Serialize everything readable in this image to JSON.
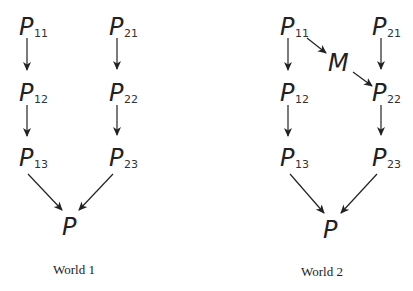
{
  "worlds": [
    {
      "caption": "World 1",
      "nodes": {
        "p11": {
          "base": "P",
          "sub": "11"
        },
        "p12": {
          "base": "P",
          "sub": "12"
        },
        "p13": {
          "base": "P",
          "sub": "13"
        },
        "p21": {
          "base": "P",
          "sub": "21"
        },
        "p22": {
          "base": "P",
          "sub": "22"
        },
        "p23": {
          "base": "P",
          "sub": "23"
        },
        "p": {
          "base": "P"
        }
      },
      "edges": [
        [
          "P11",
          "P12"
        ],
        [
          "P12",
          "P13"
        ],
        [
          "P21",
          "P22"
        ],
        [
          "P22",
          "P23"
        ],
        [
          "P13",
          "P"
        ],
        [
          "P23",
          "P"
        ]
      ]
    },
    {
      "caption": "World 2",
      "nodes": {
        "p11": {
          "base": "P",
          "sub": "11"
        },
        "p12": {
          "base": "P",
          "sub": "12"
        },
        "p13": {
          "base": "P",
          "sub": "13"
        },
        "p21": {
          "base": "P",
          "sub": "21"
        },
        "p22": {
          "base": "P",
          "sub": "22"
        },
        "p23": {
          "base": "P",
          "sub": "23"
        },
        "m": {
          "base": "M"
        },
        "p": {
          "base": "P"
        }
      },
      "edges": [
        [
          "P11",
          "P12"
        ],
        [
          "P12",
          "P13"
        ],
        [
          "P11",
          "M"
        ],
        [
          "M",
          "P22"
        ],
        [
          "P21",
          "P22"
        ],
        [
          "P22",
          "P23"
        ],
        [
          "P13",
          "P"
        ],
        [
          "P23",
          "P"
        ]
      ]
    }
  ]
}
